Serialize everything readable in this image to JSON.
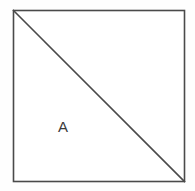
{
  "figure": {
    "background_color": "#fefefe",
    "stroke_color": "#4a4a4a",
    "label_color": "#3a3a3a",
    "square": {
      "name": "square-outline",
      "x": 13.5,
      "y": 10.5,
      "width": 171,
      "height": 171,
      "stroke_width": 1.6,
      "fill": "#ffffff"
    },
    "diagonal": {
      "name": "diagonal-line",
      "x1": 13.5,
      "y1": 10.5,
      "x2": 184.5,
      "y2": 181.5,
      "stroke_width": 1.6,
      "direction": "top-left-to-bottom-right"
    },
    "labels": [
      {
        "name": "region-label-a",
        "text": "A",
        "region": "lower-left-triangle",
        "x": 64,
        "y": 127
      }
    ]
  },
  "chart_data": {
    "type": "diagram",
    "title": "",
    "shapes": [
      {
        "kind": "square",
        "vertices": [
          [
            0,
            0
          ],
          [
            1,
            0
          ],
          [
            1,
            1
          ],
          [
            0,
            1
          ]
        ],
        "label": ""
      },
      {
        "kind": "segment",
        "from": [
          0,
          0
        ],
        "to": [
          1,
          1
        ],
        "label": ""
      },
      {
        "kind": "triangle",
        "vertices": [
          [
            0,
            0
          ],
          [
            0,
            1
          ],
          [
            1,
            1
          ]
        ],
        "label": "A"
      },
      {
        "kind": "triangle",
        "vertices": [
          [
            0,
            0
          ],
          [
            1,
            0
          ],
          [
            1,
            1
          ]
        ],
        "label": ""
      }
    ],
    "labels": [
      "A"
    ]
  }
}
